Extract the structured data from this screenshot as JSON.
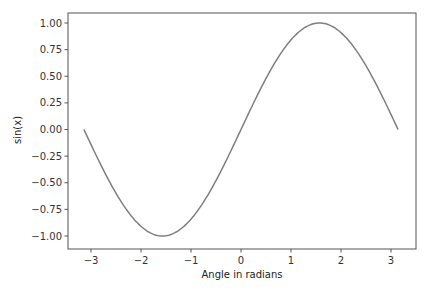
{
  "chart_data": {
    "type": "line",
    "title": "",
    "xlabel": "Angle in radians",
    "ylabel": "sin(x)",
    "xlim": [
      -3.45,
      3.45
    ],
    "ylim": [
      -1.1,
      1.1
    ],
    "grid": false,
    "legend": null,
    "x_ticks": [
      -3,
      -2,
      -1,
      0,
      1,
      2,
      3
    ],
    "x_tick_labels": [
      "−3",
      "−2",
      "−1",
      "0",
      "1",
      "2",
      "3"
    ],
    "y_ticks": [
      1.0,
      0.75,
      0.5,
      0.25,
      0.0,
      -0.25,
      -0.5,
      -0.75,
      -1.0
    ],
    "y_tick_labels": [
      "1.00",
      "0.75",
      "0.50",
      "0.25",
      "0.00",
      "−0.25",
      "−0.50",
      "−0.75",
      "−1.00"
    ],
    "series": [
      {
        "name": "sin(x)",
        "function": "sin",
        "x_range": [
          -3.14159,
          3.14159
        ],
        "color": "#7f7f7f",
        "sample_points": [
          {
            "x": -3.14,
            "y": 0.0
          },
          {
            "x": -1.57,
            "y": -1.0
          },
          {
            "x": 0.0,
            "y": 0.0
          },
          {
            "x": 1.57,
            "y": 1.0
          },
          {
            "x": 3.14,
            "y": 0.0
          }
        ]
      }
    ],
    "colors": {
      "line": "#7f7f7f",
      "frame": "#555555",
      "text": "#333333"
    }
  }
}
